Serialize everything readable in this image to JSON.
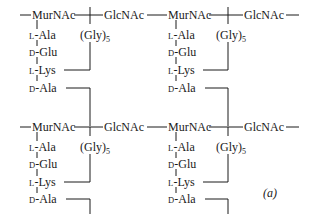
{
  "diagram": {
    "type": "peptidoglycan-structure",
    "figure_label": "(a)",
    "line_color": "#1a1a1a",
    "rows": [
      {
        "units": [
          {
            "sugar1": "MurNAc",
            "sugar2": "GlcNAc",
            "stem": [
              {
                "prefix": "L",
                "residue": "-Ala"
              },
              {
                "prefix": "D",
                "residue": "-Glu"
              },
              {
                "prefix": "L",
                "residue": "-Lys"
              },
              {
                "prefix": "D",
                "residue": "-Ala"
              }
            ],
            "bridge": {
              "text": "(Gly)",
              "sub": "5"
            }
          },
          {
            "sugar1": "MurNAc",
            "sugar2": "GlcNAc",
            "stem": [
              {
                "prefix": "L",
                "residue": "-Ala"
              },
              {
                "prefix": "D",
                "residue": "-Glu"
              },
              {
                "prefix": "L",
                "residue": "-Lys"
              },
              {
                "prefix": "D",
                "residue": "-Ala"
              }
            ],
            "bridge": {
              "text": "(Gly)",
              "sub": "5"
            }
          }
        ]
      },
      {
        "units": [
          {
            "sugar1": "MurNAc",
            "sugar2": "GlcNAc",
            "stem": [
              {
                "prefix": "L",
                "residue": "-Ala"
              },
              {
                "prefix": "D",
                "residue": "-Glu"
              },
              {
                "prefix": "L",
                "residue": "-Lys"
              },
              {
                "prefix": "D",
                "residue": "-Ala"
              }
            ],
            "bridge": {
              "text": "(Gly)",
              "sub": "5"
            }
          },
          {
            "sugar1": "MurNAc",
            "sugar2": "GlcNAc",
            "stem": [
              {
                "prefix": "L",
                "residue": "-Ala"
              },
              {
                "prefix": "D",
                "residue": "-Glu"
              },
              {
                "prefix": "L",
                "residue": "-Lys"
              },
              {
                "prefix": "D",
                "residue": "-Ala"
              }
            ],
            "bridge": {
              "text": "(Gly)",
              "sub": "5"
            }
          }
        ]
      }
    ]
  }
}
